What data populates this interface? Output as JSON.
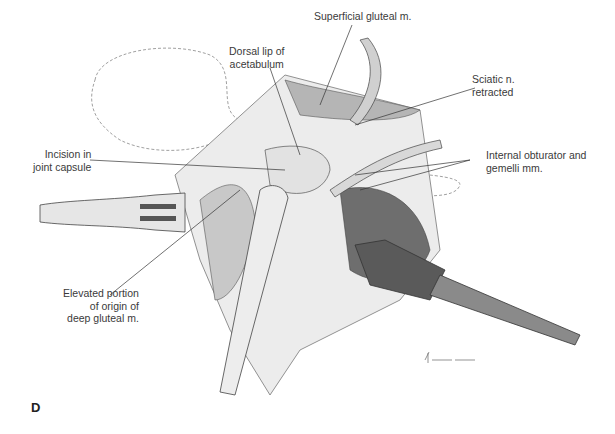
{
  "figure": {
    "panel_letter": "D",
    "labels": {
      "superficial_gluteal": "Superficial gluteal m.",
      "dorsal_lip": "Dorsal lip of\nacetabulum",
      "sciatic": "Sciatic n.\nretracted",
      "incision": "Incision in\njoint capsule",
      "internal_obturator": "Internal obturator and\ngemelli mm.",
      "elevated_portion": "Elevated portion\nof origin of\ndeep gluteal m."
    },
    "colors": {
      "background": "#ffffff",
      "ink": "#3a3a3a",
      "shade_dark": "#4a4a4a",
      "shade_mid": "#9a9a9a",
      "shade_light": "#d8d8d8"
    }
  }
}
